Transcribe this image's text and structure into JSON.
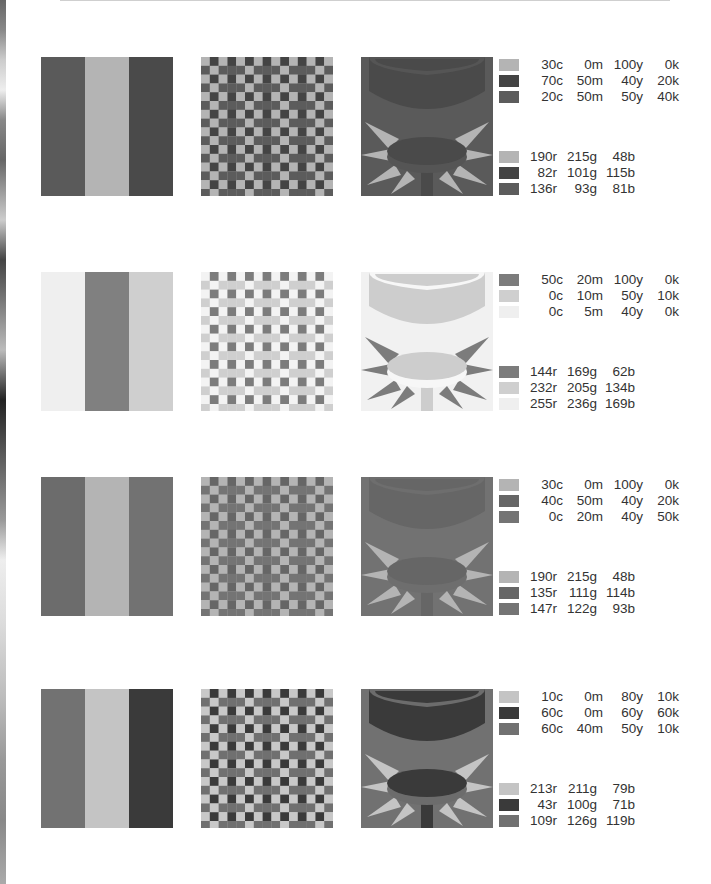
{
  "rows": [
    {
      "stripes": [
        "#5a5a5a",
        "#b4b4b4",
        "#4a4a4a"
      ],
      "checker": {
        "light": "#b4b4b4",
        "dark": "#444444",
        "mid": "#5c5c5c"
      },
      "scene": {
        "bg": "#5a5a5a",
        "ring": "#555555",
        "cup": "#4a4a4a",
        "rays": "#b4b4b4",
        "disc": "#4a4a4a",
        "stem": "#4a4a4a"
      },
      "cmyk": [
        {
          "swatch": "#b4b4b4",
          "c": "30c",
          "m": "0m",
          "y": "100y",
          "k": "0k"
        },
        {
          "swatch": "#444444",
          "c": "70c",
          "m": "50m",
          "y": "40y",
          "k": "20k"
        },
        {
          "swatch": "#5c5c5c",
          "c": "20c",
          "m": "50m",
          "y": "50y",
          "k": "40k"
        }
      ],
      "rgb": [
        {
          "swatch": "#b4b4b4",
          "r": "190r",
          "g": "215g",
          "b": "48b"
        },
        {
          "swatch": "#444444",
          "r": "82r",
          "g": "101g",
          "b": "115b"
        },
        {
          "swatch": "#5c5c5c",
          "r": "136r",
          "g": "93g",
          "b": "81b"
        }
      ]
    },
    {
      "stripes": [
        "#efefef",
        "#808080",
        "#cfcfcf"
      ],
      "checker": {
        "light": "#f3f3f3",
        "dark": "#7c7c7c",
        "mid": "#cfcfcf"
      },
      "scene": {
        "bg": "#f1f1f1",
        "ring": "#f7f7f7",
        "cup": "#cdcdcd",
        "rays": "#7c7c7c",
        "disc": "#cdcdcd",
        "stem": "#cdcdcd"
      },
      "cmyk": [
        {
          "swatch": "#7c7c7c",
          "c": "50c",
          "m": "20m",
          "y": "100y",
          "k": "0k"
        },
        {
          "swatch": "#cfcfcf",
          "c": "0c",
          "m": "10m",
          "y": "50y",
          "k": "10k"
        },
        {
          "swatch": "#efefef",
          "c": "0c",
          "m": "5m",
          "y": "40y",
          "k": "0k"
        }
      ],
      "rgb": [
        {
          "swatch": "#7c7c7c",
          "r": "144r",
          "g": "169g",
          "b": "62b"
        },
        {
          "swatch": "#cfcfcf",
          "r": "232r",
          "g": "205g",
          "b": "134b"
        },
        {
          "swatch": "#efefef",
          "r": "255r",
          "g": "236g",
          "b": "169b"
        }
      ]
    },
    {
      "stripes": [
        "#6c6c6c",
        "#b4b4b4",
        "#727272"
      ],
      "checker": {
        "light": "#b4b4b4",
        "dark": "#666666",
        "mid": "#747474"
      },
      "scene": {
        "bg": "#727272",
        "ring": "#6e6e6e",
        "cup": "#666666",
        "rays": "#b4b4b4",
        "disc": "#666666",
        "stem": "#666666"
      },
      "cmyk": [
        {
          "swatch": "#b4b4b4",
          "c": "30c",
          "m": "0m",
          "y": "100y",
          "k": "0k"
        },
        {
          "swatch": "#666666",
          "c": "40c",
          "m": "50m",
          "y": "40y",
          "k": "20k"
        },
        {
          "swatch": "#747474",
          "c": "0c",
          "m": "20m",
          "y": "40y",
          "k": "50k"
        }
      ],
      "rgb": [
        {
          "swatch": "#b4b4b4",
          "r": "190r",
          "g": "215g",
          "b": "48b"
        },
        {
          "swatch": "#666666",
          "r": "135r",
          "g": "111g",
          "b": "114b"
        },
        {
          "swatch": "#747474",
          "r": "147r",
          "g": "122g",
          "b": "93b"
        }
      ]
    },
    {
      "stripes": [
        "#727272",
        "#c4c4c4",
        "#3a3a3a"
      ],
      "checker": {
        "light": "#c8c8c8",
        "dark": "#3a3a3a",
        "mid": "#707070"
      },
      "scene": {
        "bg": "#717171",
        "ring": "#6c6c6c",
        "cup": "#3a3a3a",
        "rays": "#c4c4c4",
        "disc": "#3a3a3a",
        "stem": "#3a3a3a"
      },
      "cmyk": [
        {
          "swatch": "#c4c4c4",
          "c": "10c",
          "m": "0m",
          "y": "80y",
          "k": "10k"
        },
        {
          "swatch": "#3a3a3a",
          "c": "60c",
          "m": "0m",
          "y": "60y",
          "k": "60k"
        },
        {
          "swatch": "#717171",
          "c": "60c",
          "m": "40m",
          "y": "50y",
          "k": "10k"
        }
      ],
      "rgb": [
        {
          "swatch": "#c4c4c4",
          "r": "213r",
          "g": "211g",
          "b": "79b"
        },
        {
          "swatch": "#3a3a3a",
          "r": "43r",
          "g": "100g",
          "b": "71b"
        },
        {
          "swatch": "#717171",
          "r": "109r",
          "g": "126g",
          "b": "119b"
        }
      ]
    }
  ]
}
